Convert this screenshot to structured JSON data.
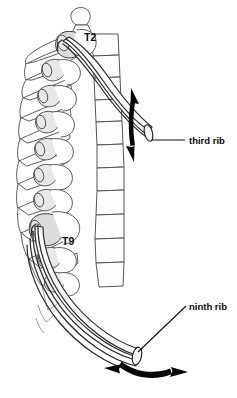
{
  "figure": {
    "background_color": "#ffffff",
    "line_color": "#2b2b2b",
    "shade_color": "#dcdcdc",
    "arrow_color": "#050505"
  },
  "vertebra_labels": [
    {
      "id": "t2",
      "text": "T2",
      "x": 84,
      "y": 41
    },
    {
      "id": "t9",
      "text": "T9",
      "x": 62,
      "y": 245
    }
  ],
  "rib_labels": [
    {
      "id": "third-rib",
      "text": "third rib",
      "x": 190,
      "y": 145
    },
    {
      "id": "ninth-rib",
      "text": "ninth rib",
      "x": 190,
      "y": 311
    }
  ],
  "motion_arrows": [
    {
      "id": "third-rib-arrow",
      "name": "pump-handle-arrow",
      "orientation": "vertical",
      "double_headed": true,
      "associated_rib": "third rib"
    },
    {
      "id": "ninth-rib-arrow",
      "name": "bucket-handle-arrow",
      "orientation": "horizontal-curved",
      "double_headed": true,
      "associated_rib": "ninth rib"
    }
  ],
  "ribs": [
    {
      "id": "third",
      "label": "third rib",
      "origin_vertebra": "T2"
    },
    {
      "id": "ninth",
      "label": "ninth rib",
      "origin_vertebra": "T9"
    }
  ]
}
